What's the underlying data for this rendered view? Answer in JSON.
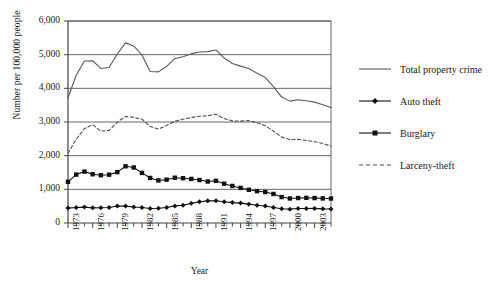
{
  "chart_data": {
    "type": "line",
    "title": "",
    "xlabel": "Year",
    "ylabel": "Number per 100,000 people",
    "xlim": [
      1973,
      2005
    ],
    "ylim": [
      0,
      6000
    ],
    "ytick_labels": [
      "0",
      "1,000",
      "2,000",
      "3,000",
      "4,000",
      "5,000",
      "6,000"
    ],
    "ytick_values": [
      0,
      1000,
      2000,
      3000,
      4000,
      5000,
      6000
    ],
    "xtick_labels": [
      "1973",
      "1976",
      "1979",
      "1982",
      "1985",
      "1988",
      "1991",
      "1994",
      "1997",
      "2000",
      "2003"
    ],
    "xtick_values": [
      1973,
      1976,
      1979,
      1982,
      1985,
      1988,
      1991,
      1994,
      1997,
      2000,
      2003
    ],
    "grid": "horizontal",
    "legend_position": "right",
    "x": [
      1973,
      1974,
      1975,
      1976,
      1977,
      1978,
      1979,
      1980,
      1981,
      1982,
      1983,
      1984,
      1985,
      1986,
      1987,
      1988,
      1989,
      1990,
      1991,
      1992,
      1993,
      1994,
      1995,
      1996,
      1997,
      1998,
      1999,
      2000,
      2001,
      2002,
      2003,
      2004,
      2005
    ],
    "series": [
      {
        "name": "Total property crime",
        "style": "solid",
        "marker": "none",
        "color": "#595959",
        "values": [
          3720,
          4390,
          4810,
          4820,
          4590,
          4620,
          5020,
          5350,
          5260,
          4990,
          4500,
          4490,
          4650,
          4880,
          4940,
          5030,
          5080,
          5090,
          5140,
          4900,
          4740,
          4660,
          4590,
          4450,
          4320,
          4050,
          3740,
          3620,
          3660,
          3630,
          3590,
          3510,
          3430
        ]
      },
      {
        "name": "Auto theft",
        "style": "solid",
        "marker": "diamond",
        "color": "#111111",
        "values": [
          443,
          462,
          473,
          450,
          452,
          460,
          506,
          502,
          475,
          459,
          431,
          437,
          462,
          508,
          529,
          583,
          630,
          658,
          659,
          632,
          606,
          591,
          560,
          526,
          506,
          459,
          422,
          412,
          431,
          432,
          433,
          421,
          417
        ]
      },
      {
        "name": "Burglary",
        "style": "solid",
        "marker": "square",
        "color": "#111111",
        "values": [
          1223,
          1438,
          1526,
          1448,
          1420,
          1435,
          1511,
          1684,
          1649,
          1488,
          1338,
          1264,
          1287,
          1345,
          1330,
          1309,
          1276,
          1232,
          1252,
          1168,
          1100,
          1042,
          987,
          945,
          919,
          863,
          770,
          729,
          741,
          747,
          741,
          730,
          727
        ]
      },
      {
        "name": "Larceny-theft",
        "style": "dashed",
        "marker": "none",
        "color": "#4d4d4d",
        "values": [
          2072,
          2490,
          2805,
          2921,
          2730,
          2747,
          2999,
          3167,
          3135,
          3084,
          2869,
          2791,
          2901,
          3022,
          3081,
          3135,
          3171,
          3185,
          3229,
          3103,
          3033,
          3026,
          3043,
          2980,
          2891,
          2729,
          2551,
          2477,
          2485,
          2451,
          2414,
          2362,
          2287
        ]
      }
    ]
  },
  "legend": {
    "items": [
      {
        "label": "Total property crime"
      },
      {
        "label": "Auto theft"
      },
      {
        "label": "Burglary"
      },
      {
        "label": "Larceny-theft"
      }
    ]
  }
}
